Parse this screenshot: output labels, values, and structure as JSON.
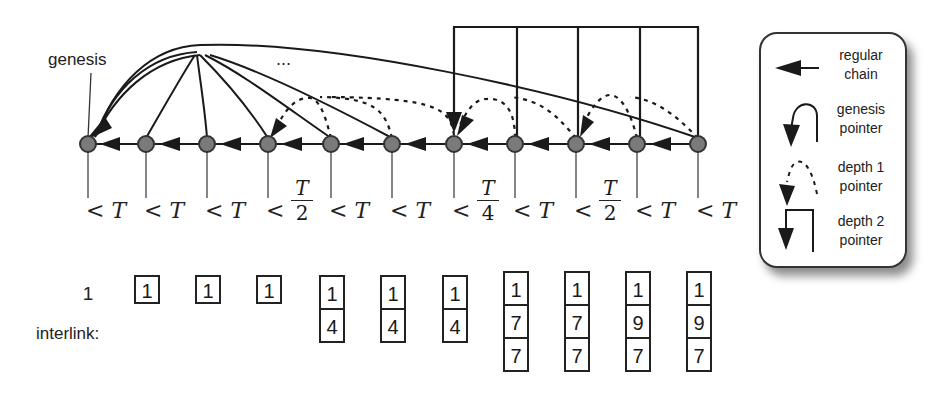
{
  "labels": {
    "genesis": "genesis",
    "interlink": "interlink:",
    "ellipsis": "..."
  },
  "blocks": [
    {
      "index": "1",
      "interlink": []
    },
    {
      "index": "2",
      "interlink": [
        "1"
      ]
    },
    {
      "index": "3",
      "interlink": [
        "1"
      ]
    },
    {
      "index": "4",
      "interlink": [
        "1"
      ]
    },
    {
      "index": "5",
      "interlink": [
        "1",
        "4"
      ]
    },
    {
      "index": "6",
      "interlink": [
        "1",
        "4"
      ]
    },
    {
      "index": "7",
      "interlink": [
        "1",
        "4"
      ]
    },
    {
      "index": "8",
      "interlink": [
        "1",
        "7",
        "7"
      ]
    },
    {
      "index": "9",
      "interlink": [
        "1",
        "7",
        "7"
      ]
    },
    {
      "index": "10",
      "interlink": [
        "1",
        "9",
        "7"
      ]
    },
    {
      "index": "11",
      "interlink": [
        "1",
        "9",
        "7"
      ]
    }
  ],
  "conditions": [
    {
      "text": "< T",
      "type": "plain"
    },
    {
      "text": "< T",
      "type": "plain"
    },
    {
      "text": "< T",
      "type": "plain"
    },
    {
      "text": "<",
      "type": "frac",
      "num": "T",
      "den": "2"
    },
    {
      "text": "< T",
      "type": "plain"
    },
    {
      "text": "< T",
      "type": "plain"
    },
    {
      "text": "<",
      "type": "frac",
      "num": "T",
      "den": "4"
    },
    {
      "text": "< T",
      "type": "plain"
    },
    {
      "text": "<",
      "type": "frac",
      "num": "T",
      "den": "2"
    },
    {
      "text": "< T",
      "type": "plain"
    },
    {
      "text": "< T",
      "type": "plain"
    }
  ],
  "legend": {
    "items": [
      {
        "label_line1": "regular",
        "label_line2": "chain",
        "icon": "left-arrow-icon"
      },
      {
        "label_line1": "genesis",
        "label_line2": "pointer",
        "icon": "curved-arrow-icon"
      },
      {
        "label_line1": "depth 1",
        "label_line2": "pointer",
        "icon": "dashed-curved-arrow-icon"
      },
      {
        "label_line1": "depth 2",
        "label_line2": "pointer",
        "icon": "square-arrow-icon"
      }
    ]
  },
  "colors": {
    "node_fill": "#7a7a7a",
    "node_stroke": "#333333",
    "line": "#1a1a1a",
    "background": "#ffffff"
  }
}
